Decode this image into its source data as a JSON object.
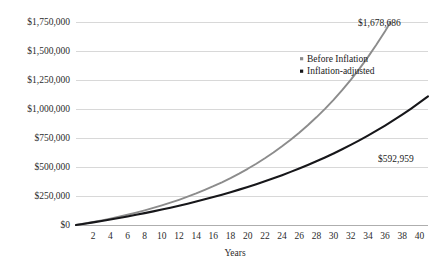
{
  "chart_data": {
    "type": "line",
    "title": "",
    "subtitle": "",
    "xlabel": "Years",
    "ylabel": "",
    "grid": true,
    "legend_position": "upper-right-inside",
    "xlim": [
      0,
      41
    ],
    "ylim": [
      0,
      1750000
    ],
    "x_tick_labels": [
      "2",
      "4",
      "6",
      "8",
      "10",
      "12",
      "14",
      "16",
      "18",
      "20",
      "22",
      "24",
      "26",
      "28",
      "30",
      "32",
      "34",
      "36",
      "38",
      "40"
    ],
    "x_tick_values": [
      2,
      4,
      6,
      8,
      10,
      12,
      14,
      16,
      18,
      20,
      22,
      24,
      26,
      28,
      30,
      32,
      34,
      36,
      38,
      40
    ],
    "y_tick_labels": [
      "$0",
      "$250,000",
      "$500,000",
      "$750,000",
      "$1,000,000",
      "$1,250,000",
      "$1,500,000",
      "$1,750,000"
    ],
    "y_tick_values": [
      0,
      250000,
      500000,
      750000,
      1000000,
      1250000,
      1500000,
      1750000
    ],
    "x": [
      0,
      1,
      2,
      3,
      4,
      5,
      6,
      7,
      8,
      9,
      10,
      11,
      12,
      13,
      14,
      15,
      16,
      17,
      18,
      19,
      20,
      21,
      22,
      23,
      24,
      25,
      26,
      27,
      28,
      29,
      30,
      31,
      32,
      33,
      34,
      35,
      36,
      37,
      38,
      39,
      40,
      41
    ],
    "series": [
      {
        "name": "Before Inflation",
        "color": "#8c8c8c",
        "end_label": "$1,678,686",
        "end_value": 1678686,
        "values": [
          0,
          12600,
          26000,
          40300,
          55500,
          71600,
          88800,
          107100,
          126500,
          147200,
          169100,
          192500,
          217400,
          243900,
          272100,
          302200,
          334200,
          368300,
          404600,
          443300,
          484500,
          528400,
          575200,
          625000,
          678200,
          734800,
          795200,
          859600,
          928300,
          1001500,
          1079500,
          1162700,
          1251500,
          1346200,
          1447400,
          1555400,
          1670800,
          1794000,
          1925600,
          2066200,
          2216400,
          2376900
        ]
      },
      {
        "name": "Inflation-adjusted",
        "color": "#17171a",
        "end_label": "$592,959",
        "end_value": 592959,
        "values": [
          0,
          11200,
          22800,
          34900,
          47400,
          60400,
          73900,
          87900,
          102400,
          117500,
          133200,
          149500,
          166400,
          184000,
          202300,
          221300,
          241000,
          261500,
          282800,
          305000,
          328000,
          352000,
          376900,
          402800,
          429800,
          457900,
          487200,
          517600,
          549400,
          582500,
          617000,
          653000,
          690500,
          729600,
          770400,
          812900,
          857200,
          903400,
          951600,
          1001800,
          1054100,
          1108700
        ]
      }
    ],
    "annotations": [
      {
        "text": "$1,678,686",
        "series": "Before Inflation"
      },
      {
        "text": "$592,959",
        "series": "Inflation-adjusted"
      }
    ]
  },
  "legend": {
    "items": [
      {
        "label": "Before Inflation",
        "marker": "bullet-marker",
        "color": "#8c8c8c"
      },
      {
        "label": "Inflation-adjusted",
        "marker": "bullet-marker",
        "color": "#17171a"
      }
    ]
  },
  "colors": {
    "before_inflation": "#8c8c8c",
    "inflation_adjusted": "#17171a",
    "gridline": "#c8c8c8",
    "background": "#ffffff"
  }
}
